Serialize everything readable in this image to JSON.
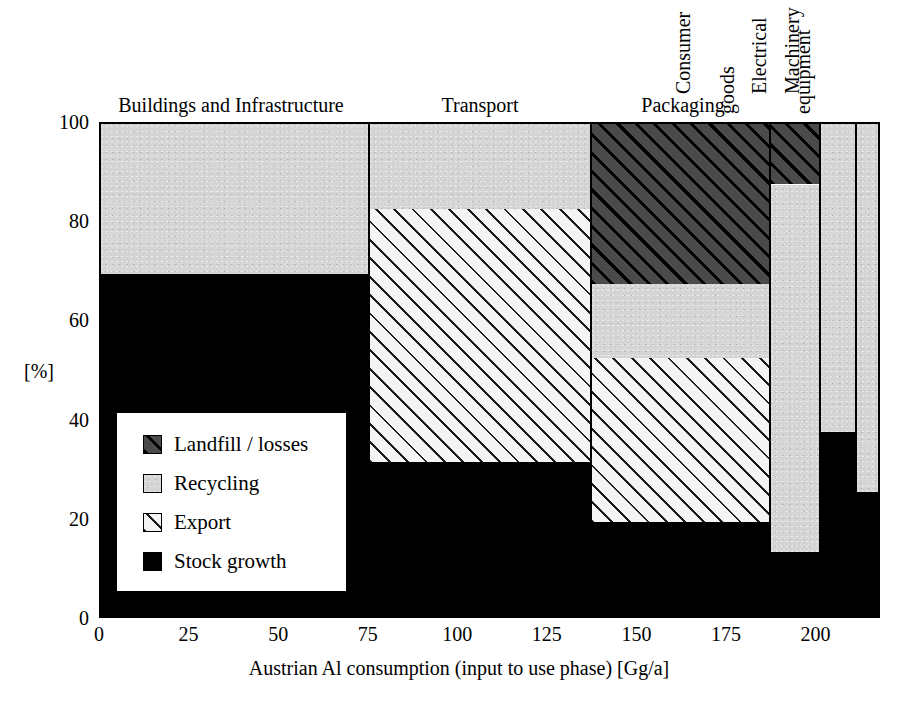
{
  "chart_data": {
    "type": "bar",
    "variant": "marimekko-stacked-100pct",
    "title": "",
    "xlabel": "Austrian Al consumption (input to use phase) [Gg/a]",
    "ylabel": "[%]",
    "xlim": [
      0,
      218
    ],
    "ylim": [
      0,
      100
    ],
    "xticks": [
      0,
      25,
      50,
      75,
      100,
      125,
      150,
      175,
      200
    ],
    "yticks": [
      0,
      20,
      40,
      60,
      80,
      100
    ],
    "grid": false,
    "legend_position": "inside-lower-left",
    "series": [
      {
        "name": "Landfill / losses",
        "key": "landfill",
        "values": [
          0,
          0,
          33,
          13,
          0,
          0
        ]
      },
      {
        "name": "Recycling",
        "key": "recycling",
        "values": [
          31,
          18,
          15,
          74,
          63,
          75
        ]
      },
      {
        "name": "Export",
        "key": "export",
        "values": [
          0,
          51,
          33,
          0,
          0,
          0
        ]
      },
      {
        "name": "Stock growth",
        "key": "stock",
        "values": [
          69,
          31,
          19,
          13,
          37,
          25
        ]
      }
    ],
    "categories": [
      {
        "label": "Buildings and Infrastructure",
        "orientation": "horizontal",
        "x_start": 0,
        "x_end": 75,
        "width_gg": 75
      },
      {
        "label": "Transport",
        "orientation": "horizontal",
        "x_start": 75,
        "x_end": 137,
        "width_gg": 62
      },
      {
        "label": "Packaging",
        "orientation": "horizontal",
        "x_start": 137,
        "x_end": 187,
        "width_gg": 50
      },
      {
        "label": "Consumer goods",
        "orientation": "vertical",
        "label_line1": "Consumer",
        "label_line2": "goods",
        "x_start": 187,
        "x_end": 201,
        "width_gg": 14
      },
      {
        "label": "Machinery",
        "orientation": "vertical",
        "label_line1": "Machinery",
        "label_line2": "",
        "x_start": 201,
        "x_end": 211,
        "width_gg": 10
      },
      {
        "label": "Electrical equipment",
        "orientation": "vertical",
        "label_line1": "Electrical",
        "label_line2": "equipment",
        "x_start": 211,
        "x_end": 218,
        "width_gg": 7
      }
    ],
    "stacks": [
      {
        "category": "Buildings and Infrastructure",
        "bands": [
          {
            "key": "stock",
            "from": 0,
            "to": 69
          },
          {
            "key": "recycling",
            "from": 69,
            "to": 100
          }
        ]
      },
      {
        "category": "Transport",
        "bands": [
          {
            "key": "stock",
            "from": 0,
            "to": 31
          },
          {
            "key": "export",
            "from": 31,
            "to": 82
          },
          {
            "key": "recycling",
            "from": 82,
            "to": 100
          }
        ]
      },
      {
        "category": "Packaging",
        "bands": [
          {
            "key": "stock",
            "from": 0,
            "to": 19
          },
          {
            "key": "export",
            "from": 19,
            "to": 52
          },
          {
            "key": "recycling",
            "from": 52,
            "to": 67
          },
          {
            "key": "landfill",
            "from": 67,
            "to": 100
          }
        ]
      },
      {
        "category": "Consumer goods",
        "bands": [
          {
            "key": "stock",
            "from": 0,
            "to": 13
          },
          {
            "key": "recycling",
            "from": 13,
            "to": 87
          },
          {
            "key": "landfill",
            "from": 87,
            "to": 100
          }
        ]
      },
      {
        "category": "Machinery",
        "bands": [
          {
            "key": "stock",
            "from": 0,
            "to": 37
          },
          {
            "key": "recycling",
            "from": 37,
            "to": 100
          }
        ]
      },
      {
        "category": "Electrical equipment",
        "bands": [
          {
            "key": "stock",
            "from": 0,
            "to": 25
          },
          {
            "key": "recycling",
            "from": 25,
            "to": 100
          }
        ]
      }
    ]
  },
  "axes": {
    "ylabel": "[%]",
    "xlabel": "Austrian Al consumption (input to use phase) [Gg/a]",
    "yticks": [
      "0",
      "20",
      "40",
      "60",
      "80",
      "100"
    ],
    "xticks": [
      "0",
      "25",
      "50",
      "75",
      "100",
      "125",
      "150",
      "175",
      "200"
    ]
  },
  "category_titles": {
    "buildings": "Buildings and Infrastructure",
    "transport": "Transport",
    "packaging": "Packaging",
    "consumer_line1": "Consumer",
    "consumer_line2": "goods",
    "machinery": "Machinery",
    "electrical_line1": "Electrical",
    "electrical_line2": "equipment"
  },
  "legend": {
    "items": [
      {
        "label": "Landfill / losses",
        "key": "landfill"
      },
      {
        "label": "Recycling",
        "key": "recycling"
      },
      {
        "label": "Export",
        "key": "export"
      },
      {
        "label": "Stock growth",
        "key": "stock"
      }
    ]
  },
  "colors": {
    "stock_growth": "#000000",
    "recycling": "#d4d4d4",
    "export": "#f4f4f4",
    "landfill": "#2b2b2b",
    "axis": "#000000",
    "background": "#ffffff"
  }
}
